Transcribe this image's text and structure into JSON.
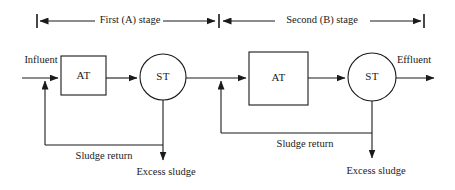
{
  "diagram": {
    "line_color": "#1a1a1a",
    "background_color": "#ffffff",
    "stages": [
      {
        "id": "stage-a",
        "bracket_label": "First (A) stage",
        "aeration_tank_label": "AT",
        "settling_tank_label": "ST",
        "sludge_return_label": "Sludge return",
        "excess_sludge_label": "Excess sludge"
      },
      {
        "id": "stage-b",
        "bracket_label": "Second (B) stage",
        "aeration_tank_label": "AT",
        "settling_tank_label": "ST",
        "sludge_return_label": "Sludge return",
        "excess_sludge_label": "Excess sludge"
      }
    ],
    "streams": {
      "influent_label": "Influent",
      "effluent_label": "Effluent"
    }
  }
}
